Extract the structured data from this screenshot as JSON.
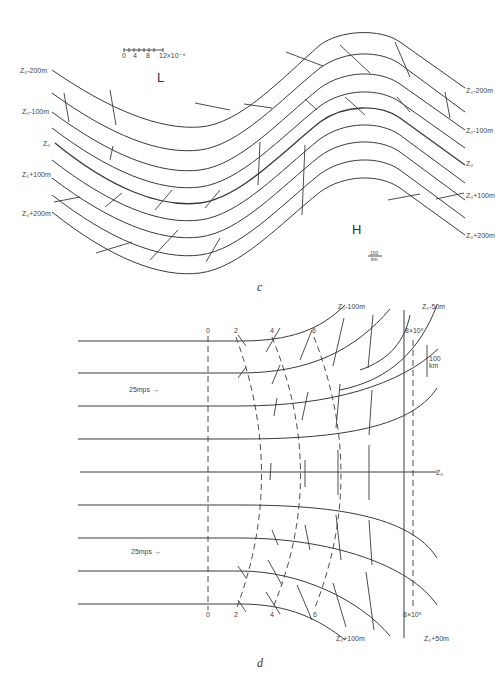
{
  "panel_c": {
    "caption": "c",
    "low_label": "L",
    "high_label": "H",
    "scale_bar": {
      "ticks": [
        "0",
        "4",
        "8",
        "12×10⁻⁶"
      ]
    },
    "distance_scale": {
      "value": "100",
      "unit": "km"
    },
    "left_labels": [
      "Z₀-200m",
      "Z₀-100m",
      "Z₀",
      "Z₀+100m",
      "Z₀+200m"
    ],
    "right_labels": [
      "Z₀-200m",
      "Z₀-100m",
      "Z₀",
      "Z₀+100m",
      "Z₀+200m"
    ]
  },
  "panel_d": {
    "caption": "d",
    "wind_labels": [
      "25mps →",
      "25mps →"
    ],
    "top_isoline_labels": [
      "0",
      "2",
      "4",
      "6",
      "8×10⁵"
    ],
    "bottom_isoline_labels": [
      "0",
      "2",
      "4",
      "6",
      "8×10⁵"
    ],
    "top_contour_labels": [
      "Z₀-100m",
      "Z₀-50m"
    ],
    "bottom_contour_labels": [
      "Z₀+100m",
      "Z₀+50m"
    ],
    "axis_label": "Z₀",
    "distance_scale": {
      "value": "100",
      "unit": "km"
    }
  }
}
